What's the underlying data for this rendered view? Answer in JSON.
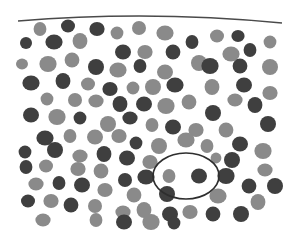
{
  "figure": {
    "width": 303,
    "height": 248,
    "background": "#ffffff",
    "colors": {
      "light": "#8a8a8a",
      "dark": "#3f3f3f",
      "line": "#4a4a4a"
    },
    "top_line": {
      "path": "M18 21 Q150 10 282 23"
    },
    "highlight_ellipse": {
      "cx": 186,
      "cy": 176,
      "rx": 33,
      "ry": 23
    },
    "particles": [
      {
        "x": 40,
        "y": 29,
        "r": 7,
        "t": "L"
      },
      {
        "x": 68,
        "y": 26,
        "r": 7,
        "t": "D"
      },
      {
        "x": 97,
        "y": 29,
        "r": 7,
        "t": "D"
      },
      {
        "x": 117,
        "y": 33,
        "r": 7,
        "t": "L"
      },
      {
        "x": 139,
        "y": 28,
        "r": 7,
        "t": "L"
      },
      {
        "x": 165,
        "y": 33,
        "r": 8,
        "t": "L"
      },
      {
        "x": 192,
        "y": 42,
        "r": 7,
        "t": "D"
      },
      {
        "x": 217,
        "y": 36,
        "r": 7,
        "t": "L"
      },
      {
        "x": 238,
        "y": 36,
        "r": 6,
        "t": "D"
      },
      {
        "x": 270,
        "y": 42,
        "r": 7,
        "t": "L"
      },
      {
        "x": 26,
        "y": 43,
        "r": 6,
        "t": "D"
      },
      {
        "x": 54,
        "y": 42,
        "r": 8,
        "t": "D"
      },
      {
        "x": 80,
        "y": 41,
        "r": 8,
        "t": "L"
      },
      {
        "x": 123,
        "y": 52,
        "r": 8,
        "t": "D"
      },
      {
        "x": 145,
        "y": 52,
        "r": 7,
        "t": "L"
      },
      {
        "x": 173,
        "y": 52,
        "r": 8,
        "t": "D"
      },
      {
        "x": 199,
        "y": 63,
        "r": 8,
        "t": "L"
      },
      {
        "x": 231,
        "y": 54,
        "r": 8,
        "t": "L"
      },
      {
        "x": 250,
        "y": 50,
        "r": 7,
        "t": "D"
      },
      {
        "x": 22,
        "y": 64,
        "r": 6,
        "t": "L"
      },
      {
        "x": 48,
        "y": 64,
        "r": 8,
        "t": "L"
      },
      {
        "x": 72,
        "y": 60,
        "r": 8,
        "t": "L"
      },
      {
        "x": 96,
        "y": 67,
        "r": 8,
        "t": "D"
      },
      {
        "x": 118,
        "y": 70,
        "r": 8,
        "t": "L"
      },
      {
        "x": 140,
        "y": 66,
        "r": 7,
        "t": "D"
      },
      {
        "x": 165,
        "y": 72,
        "r": 8,
        "t": "L"
      },
      {
        "x": 210,
        "y": 66,
        "r": 8,
        "t": "D"
      },
      {
        "x": 240,
        "y": 66,
        "r": 8,
        "t": "D"
      },
      {
        "x": 270,
        "y": 67,
        "r": 8,
        "t": "L"
      },
      {
        "x": 31,
        "y": 83,
        "r": 8,
        "t": "D"
      },
      {
        "x": 63,
        "y": 81,
        "r": 8,
        "t": "D"
      },
      {
        "x": 88,
        "y": 84,
        "r": 7,
        "t": "L"
      },
      {
        "x": 110,
        "y": 89,
        "r": 7,
        "t": "D"
      },
      {
        "x": 133,
        "y": 88,
        "r": 7,
        "t": "L"
      },
      {
        "x": 153,
        "y": 87,
        "r": 8,
        "t": "L"
      },
      {
        "x": 175,
        "y": 85,
        "r": 8,
        "t": "D"
      },
      {
        "x": 212,
        "y": 87,
        "r": 8,
        "t": "L"
      },
      {
        "x": 244,
        "y": 85,
        "r": 8,
        "t": "D"
      },
      {
        "x": 270,
        "y": 93,
        "r": 7,
        "t": "L"
      },
      {
        "x": 47,
        "y": 99,
        "r": 7,
        "t": "L"
      },
      {
        "x": 75,
        "y": 100,
        "r": 7,
        "t": "L"
      },
      {
        "x": 96,
        "y": 101,
        "r": 7,
        "t": "L"
      },
      {
        "x": 120,
        "y": 104,
        "r": 8,
        "t": "D"
      },
      {
        "x": 144,
        "y": 104,
        "r": 8,
        "t": "D"
      },
      {
        "x": 166,
        "y": 106,
        "r": 8,
        "t": "L"
      },
      {
        "x": 189,
        "y": 102,
        "r": 8,
        "t": "L"
      },
      {
        "x": 213,
        "y": 113,
        "r": 8,
        "t": "D"
      },
      {
        "x": 235,
        "y": 100,
        "r": 7,
        "t": "L"
      },
      {
        "x": 255,
        "y": 105,
        "r": 8,
        "t": "D"
      },
      {
        "x": 31,
        "y": 115,
        "r": 8,
        "t": "D"
      },
      {
        "x": 57,
        "y": 117,
        "r": 8,
        "t": "L"
      },
      {
        "x": 80,
        "y": 118,
        "r": 7,
        "t": "D"
      },
      {
        "x": 108,
        "y": 124,
        "r": 8,
        "t": "L"
      },
      {
        "x": 130,
        "y": 118,
        "r": 7,
        "t": "D"
      },
      {
        "x": 152,
        "y": 125,
        "r": 7,
        "t": "L"
      },
      {
        "x": 173,
        "y": 127,
        "r": 8,
        "t": "D"
      },
      {
        "x": 196,
        "y": 130,
        "r": 7,
        "t": "L"
      },
      {
        "x": 226,
        "y": 130,
        "r": 8,
        "t": "L"
      },
      {
        "x": 268,
        "y": 124,
        "r": 8,
        "t": "D"
      },
      {
        "x": 45,
        "y": 138,
        "r": 8,
        "t": "D"
      },
      {
        "x": 70,
        "y": 136,
        "r": 7,
        "t": "L"
      },
      {
        "x": 95,
        "y": 137,
        "r": 8,
        "t": "L"
      },
      {
        "x": 119,
        "y": 136,
        "r": 7,
        "t": "L"
      },
      {
        "x": 136,
        "y": 143,
        "r": 7,
        "t": "D"
      },
      {
        "x": 159,
        "y": 146,
        "r": 8,
        "t": "L"
      },
      {
        "x": 186,
        "y": 140,
        "r": 8,
        "t": "L"
      },
      {
        "x": 207,
        "y": 146,
        "r": 7,
        "t": "L"
      },
      {
        "x": 240,
        "y": 144,
        "r": 8,
        "t": "D"
      },
      {
        "x": 263,
        "y": 151,
        "r": 8,
        "t": "L"
      },
      {
        "x": 25,
        "y": 152,
        "r": 7,
        "t": "D"
      },
      {
        "x": 55,
        "y": 150,
        "r": 8,
        "t": "D"
      },
      {
        "x": 80,
        "y": 156,
        "r": 7,
        "t": "L"
      },
      {
        "x": 104,
        "y": 154,
        "r": 8,
        "t": "D"
      },
      {
        "x": 127,
        "y": 158,
        "r": 8,
        "t": "D"
      },
      {
        "x": 150,
        "y": 162,
        "r": 7,
        "t": "L"
      },
      {
        "x": 216,
        "y": 158,
        "r": 6,
        "t": "L"
      },
      {
        "x": 232,
        "y": 160,
        "r": 8,
        "t": "D"
      },
      {
        "x": 265,
        "y": 170,
        "r": 7,
        "t": "L"
      },
      {
        "x": 26,
        "y": 167,
        "r": 7,
        "t": "D"
      },
      {
        "x": 46,
        "y": 166,
        "r": 7,
        "t": "L"
      },
      {
        "x": 78,
        "y": 169,
        "r": 7,
        "t": "L"
      },
      {
        "x": 101,
        "y": 171,
        "r": 8,
        "t": "L"
      },
      {
        "x": 125,
        "y": 180,
        "r": 7,
        "t": "D"
      },
      {
        "x": 146,
        "y": 177,
        "r": 8,
        "t": "D"
      },
      {
        "x": 169,
        "y": 176,
        "r": 7,
        "t": "L"
      },
      {
        "x": 199,
        "y": 176,
        "r": 8,
        "t": "D"
      },
      {
        "x": 226,
        "y": 176,
        "r": 8,
        "t": "D"
      },
      {
        "x": 249,
        "y": 186,
        "r": 8,
        "t": "D"
      },
      {
        "x": 275,
        "y": 186,
        "r": 8,
        "t": "D"
      },
      {
        "x": 36,
        "y": 184,
        "r": 7,
        "t": "L"
      },
      {
        "x": 59,
        "y": 183,
        "r": 7,
        "t": "D"
      },
      {
        "x": 82,
        "y": 185,
        "r": 8,
        "t": "D"
      },
      {
        "x": 105,
        "y": 190,
        "r": 7,
        "t": "L"
      },
      {
        "x": 134,
        "y": 195,
        "r": 8,
        "t": "L"
      },
      {
        "x": 167,
        "y": 194,
        "r": 8,
        "t": "D"
      },
      {
        "x": 218,
        "y": 196,
        "r": 8,
        "t": "L"
      },
      {
        "x": 258,
        "y": 202,
        "r": 8,
        "t": "L"
      },
      {
        "x": 28,
        "y": 201,
        "r": 7,
        "t": "D"
      },
      {
        "x": 51,
        "y": 201,
        "r": 7,
        "t": "L"
      },
      {
        "x": 71,
        "y": 205,
        "r": 8,
        "t": "D"
      },
      {
        "x": 95,
        "y": 206,
        "r": 7,
        "t": "L"
      },
      {
        "x": 123,
        "y": 212,
        "r": 7,
        "t": "L"
      },
      {
        "x": 144,
        "y": 210,
        "r": 8,
        "t": "L"
      },
      {
        "x": 170,
        "y": 214,
        "r": 8,
        "t": "D"
      },
      {
        "x": 190,
        "y": 212,
        "r": 7,
        "t": "L"
      },
      {
        "x": 213,
        "y": 214,
        "r": 8,
        "t": "D"
      },
      {
        "x": 241,
        "y": 214,
        "r": 8,
        "t": "D"
      },
      {
        "x": 43,
        "y": 220,
        "r": 7,
        "t": "L"
      },
      {
        "x": 96,
        "y": 220,
        "r": 7,
        "t": "L"
      },
      {
        "x": 124,
        "y": 222,
        "r": 8,
        "t": "D"
      },
      {
        "x": 151,
        "y": 222,
        "r": 8,
        "t": "L"
      },
      {
        "x": 174,
        "y": 223,
        "r": 7,
        "t": "D"
      }
    ]
  }
}
